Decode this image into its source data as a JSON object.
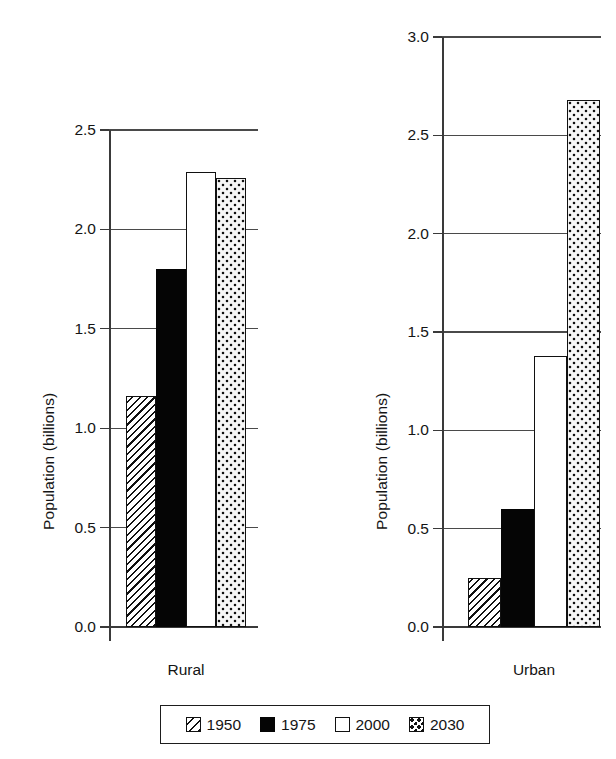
{
  "chart_data": {
    "type": "bar",
    "title": "",
    "subtitle": "",
    "categories": [
      "Rural",
      "Urban"
    ],
    "series": [
      {
        "name": "1950",
        "values": [
          1.16,
          0.25
        ],
        "pattern": "diagonal-hatch"
      },
      {
        "name": "1975",
        "values": [
          1.8,
          0.6
        ],
        "pattern": "solid-black"
      },
      {
        "name": "2000",
        "values": [
          2.29,
          1.38
        ],
        "pattern": "open-white"
      },
      {
        "name": "2030",
        "values": [
          2.26,
          2.68
        ],
        "pattern": "dotted"
      }
    ],
    "xlabel": "",
    "ylabel": "Population (billions)",
    "grid": true,
    "legend_position": "bottom",
    "panels": [
      {
        "category": "Rural",
        "ylabel": "Population (billions)",
        "ylim": [
          0.0,
          2.5
        ],
        "ytick_labels": [
          "0.0",
          "0.5",
          "1.0",
          "1.5",
          "2.0",
          "2.5"
        ],
        "ytick_values": [
          0.0,
          0.5,
          1.0,
          1.5,
          2.0,
          2.5
        ],
        "bars": [
          {
            "series": "1950",
            "value": 1.16,
            "pattern": "diagonal-hatch"
          },
          {
            "series": "1975",
            "value": 1.8,
            "pattern": "solid-black"
          },
          {
            "series": "2000",
            "value": 2.29,
            "pattern": "open-white"
          },
          {
            "series": "2030",
            "value": 2.26,
            "pattern": "dotted"
          }
        ]
      },
      {
        "category": "Urban",
        "ylabel": "Population (billions)",
        "ylim": [
          0.0,
          3.0
        ],
        "ytick_labels": [
          "0.0",
          "0.5",
          "1.0",
          "1.5",
          "2.0",
          "2.5",
          "3.0"
        ],
        "ytick_values": [
          0.0,
          0.5,
          1.0,
          1.5,
          2.0,
          2.5,
          3.0
        ],
        "bars": [
          {
            "series": "1950",
            "value": 0.25,
            "pattern": "diagonal-hatch"
          },
          {
            "series": "1975",
            "value": 0.6,
            "pattern": "solid-black"
          },
          {
            "series": "2000",
            "value": 1.38,
            "pattern": "open-white"
          },
          {
            "series": "2030",
            "value": 2.68,
            "pattern": "dotted"
          }
        ]
      }
    ]
  },
  "legend": {
    "entries": [
      {
        "label": "1950",
        "pattern": "diagonal-hatch"
      },
      {
        "label": "1975",
        "pattern": "solid-black"
      },
      {
        "label": "2000",
        "pattern": "open-white"
      },
      {
        "label": "2030",
        "pattern": "dotted"
      }
    ]
  },
  "colors": {
    "ink": "#111111",
    "axis": "#3a3a3a",
    "background": "#ffffff"
  }
}
